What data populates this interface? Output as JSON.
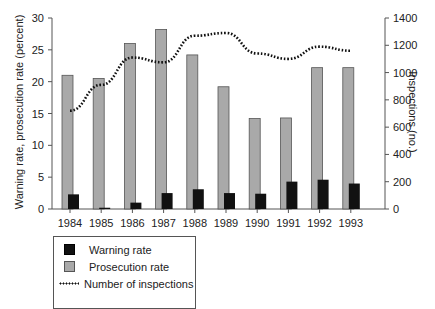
{
  "chart_data": {
    "type": "bar",
    "title": "",
    "categories": [
      "1984",
      "1985",
      "1986",
      "1987",
      "1988",
      "1989",
      "1990",
      "1991",
      "1992",
      "1993"
    ],
    "series": [
      {
        "name": "Warning rate",
        "type": "bar",
        "axis": "left",
        "color": "#111111",
        "values": [
          2.3,
          0.2,
          1.0,
          2.5,
          3.1,
          2.5,
          2.4,
          4.3,
          4.6,
          4.0
        ]
      },
      {
        "name": "Prosecution rate",
        "type": "bar",
        "axis": "left",
        "color": "#a9a9a9",
        "values": [
          21.0,
          20.5,
          26.0,
          28.2,
          24.2,
          19.2,
          14.2,
          14.3,
          22.2,
          22.2
        ]
      },
      {
        "name": "Number of inspections",
        "type": "line",
        "style": "dotted",
        "axis": "right",
        "color": "#111111",
        "values": [
          720,
          910,
          1110,
          1075,
          1270,
          1290,
          1140,
          1100,
          1190,
          1160
        ]
      }
    ],
    "xlabel": "",
    "ylabel": "Warning rate, prosecution rate (percent)",
    "ylim": [
      0,
      30
    ],
    "yticks": [
      0,
      5,
      10,
      15,
      20,
      25,
      30
    ],
    "y2label": "Inspections (no.)",
    "y2lim": [
      0,
      1400
    ],
    "y2ticks": [
      0,
      200,
      400,
      600,
      800,
      1000,
      1200,
      1400
    ],
    "grid": false,
    "legend_position": "bottom-left"
  },
  "legend": {
    "items": [
      {
        "label": "Warning rate"
      },
      {
        "label": "Prosecution rate"
      },
      {
        "label": "Number of inspections"
      }
    ]
  }
}
